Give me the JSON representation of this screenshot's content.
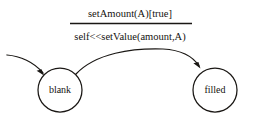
{
  "diagram": {
    "type": "uml-state-transition-diagram",
    "title": "",
    "background_color": "#ffffff",
    "ink_color": "#1a1714",
    "states": [
      {
        "id": "blank",
        "label": "blank",
        "shape": "circle",
        "cx": 60,
        "cy": 90,
        "r": 22
      },
      {
        "id": "filled",
        "label": "filled",
        "shape": "circle",
        "cx": 215,
        "cy": 90,
        "r": 22
      }
    ],
    "transitions": [
      {
        "id": "initial-entry",
        "from": "",
        "to": "blank",
        "label": "",
        "style": "curved-arrow"
      },
      {
        "id": "blank-to-filled",
        "from": "blank",
        "to": "filled",
        "event_label": "setAmount(A)[true]",
        "action_label": "self<<setValue(amount,A)",
        "style": "curved-arrow"
      }
    ],
    "labels": {
      "event": "setAmount(A)[true]",
      "action": "self<<setValue(amount,A)",
      "divider": "horizontal-rule"
    }
  }
}
